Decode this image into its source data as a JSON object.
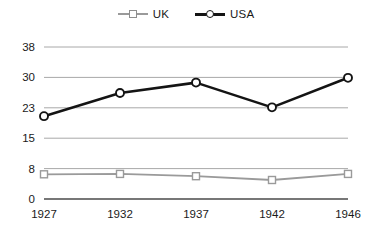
{
  "chart_data": {
    "type": "line",
    "title": "",
    "xlabel": "",
    "ylabel": "",
    "categories": [
      "1927",
      "1932",
      "1937",
      "1942",
      "1946"
    ],
    "yticks": [
      0,
      8,
      15,
      23,
      30,
      38
    ],
    "ytick_labels": [
      "0",
      "8",
      "15",
      "23",
      "30",
      "38"
    ],
    "ylim": [
      0,
      38
    ],
    "grid": true,
    "legend_position": "top-center",
    "series": [
      {
        "name": "UK",
        "color": "#9a9a9a",
        "marker": "square",
        "values": [
          6.5,
          6.6,
          6.0,
          5.0,
          6.6
        ]
      },
      {
        "name": "USA",
        "color": "#141414",
        "marker": "circle",
        "values": [
          20.8,
          26.4,
          28.8,
          23.1,
          29.9
        ]
      }
    ]
  },
  "legend": {
    "items": [
      {
        "label": "UK",
        "marker": "square-marker-icon"
      },
      {
        "label": "USA",
        "marker": "circle-marker-icon"
      }
    ]
  },
  "axes": {
    "y_labels": [
      "38",
      "30",
      "23",
      "15",
      "8",
      "0"
    ],
    "x_labels": [
      "1927",
      "1932",
      "1937",
      "1942",
      "1946"
    ]
  },
  "colors": {
    "uk_line": "#9a9a9a",
    "usa_line": "#141414",
    "gridline": "#a8a8a8",
    "baseline": "#4a4a4a",
    "background": "#ffffff"
  }
}
